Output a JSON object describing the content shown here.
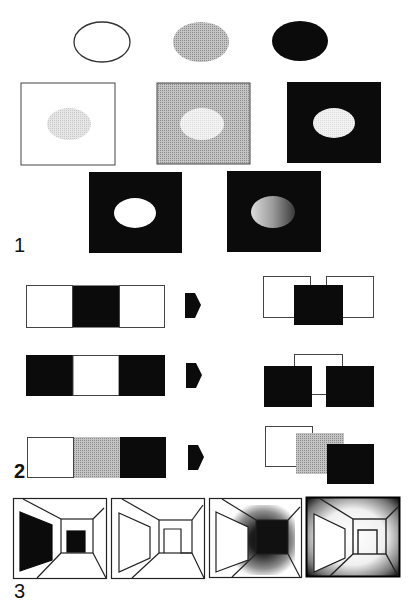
{
  "figure": {
    "sections": [
      {
        "label": "1",
        "title": "Ellipse brightness relative to background"
      },
      {
        "label": "2",
        "title": "Strip patterns perceived as overlapping squares"
      },
      {
        "label": "3",
        "title": "Corridor perspective drawings with shading"
      }
    ]
  },
  "colors": {
    "black": "#0b0b0b",
    "gray": "#a9a9a9",
    "light_gray": "#d9d9d9",
    "white": "#ffffff",
    "stroke": "#333333"
  },
  "section1": {
    "ellipses": [
      {
        "name": "white-ellipse",
        "fill": "white"
      },
      {
        "name": "gray-ellipse",
        "fill": "gray"
      },
      {
        "name": "black-ellipse",
        "fill": "black"
      }
    ],
    "squares_row": [
      {
        "background": "white",
        "inner": "light-gray"
      },
      {
        "background": "gray",
        "inner": "very-light-gray"
      },
      {
        "background": "black",
        "inner": "very-light-gray"
      }
    ],
    "bottom_row": [
      {
        "background": "black",
        "inner": "white"
      },
      {
        "background": "black",
        "inner": "gradient-light-to-dark"
      }
    ]
  },
  "section2": {
    "rows": [
      {
        "strip": [
          "white",
          "black",
          "white"
        ],
        "result": "black square over two white squares"
      },
      {
        "strip": [
          "black",
          "white",
          "black"
        ],
        "result": "two black squares over a white square"
      },
      {
        "strip": [
          "white",
          "gray",
          "black"
        ],
        "result": "three stacked squares white, gray, black"
      }
    ]
  },
  "section3": {
    "panels": [
      {
        "style": "black wall and black end opening"
      },
      {
        "style": "outline only"
      },
      {
        "style": "dark shaded far end"
      },
      {
        "style": "dark shaded edges"
      }
    ]
  }
}
